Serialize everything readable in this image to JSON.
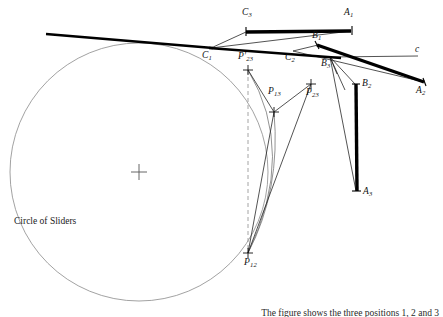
{
  "figure": {
    "title_text": "Circle of Sliders",
    "caption_tail": "The figure shows the three positions 1, 2 and 3",
    "colors": {
      "thick_link": "#000000",
      "thin_line": "#1a1a1a",
      "circle": "#8a8a8a",
      "dashed": "#9a9a9a",
      "arc": "#6f6f6f",
      "background": "#ffffff"
    },
    "circle_of_sliders": {
      "label": "Circle of Sliders",
      "label_x": 14,
      "label_y": 221,
      "cx": 139,
      "cy": 172,
      "r": 129,
      "center_marker": "cross"
    },
    "points": [
      {
        "id": "C1",
        "label": "C",
        "sub": "1",
        "x": 211,
        "y": 48,
        "lx": 203,
        "ly": 52,
        "marker": "none"
      },
      {
        "id": "C2",
        "label": "C",
        "sub": "2",
        "x": 293,
        "y": 51,
        "lx": 286,
        "ly": 54,
        "marker": "none"
      },
      {
        "id": "C3",
        "label": "C",
        "sub": "3",
        "x": 330,
        "y": 57,
        "lx": 322,
        "ly": 60,
        "marker": "none"
      },
      {
        "id": "A1",
        "label": "A",
        "sub": "1",
        "x": 246,
        "y": 31,
        "lx": 242,
        "ly": 12,
        "marker": "none"
      },
      {
        "id": "B1",
        "label": "B",
        "sub": "1",
        "x": 351,
        "y": 30,
        "lx": 344,
        "ly": 12,
        "marker": "none"
      },
      {
        "id": "A2",
        "label": "A",
        "sub": "2",
        "x": 318,
        "y": 44,
        "lx": 313,
        "ly": 36,
        "marker": "none"
      },
      {
        "id": "B2",
        "label": "B",
        "sub": "2",
        "x": 424,
        "y": 82,
        "lx": 417,
        "ly": 87,
        "marker": "none"
      },
      {
        "id": "A3",
        "label": "A",
        "sub": "3",
        "x": 356,
        "y": 83,
        "lx": 360,
        "ly": 82,
        "marker": "none"
      },
      {
        "id": "B3",
        "label": "B",
        "sub": "3",
        "x": 356,
        "y": 192,
        "lx": 360,
        "ly": 190,
        "marker": "none"
      },
      {
        "id": "P12",
        "label": "P",
        "sub": "12",
        "x": 248,
        "y": 253,
        "lx": 247,
        "ly": 261,
        "marker": "cross"
      },
      {
        "id": "P13",
        "label": "P",
        "sub": "13",
        "x": 274,
        "y": 112,
        "lx": 273,
        "ly": 90,
        "marker": "cross"
      },
      {
        "id": "P23",
        "label": "P",
        "sub": "23",
        "x": 311,
        "y": 84,
        "lx": 310,
        "ly": 91,
        "marker": "cross"
      },
      {
        "id": "P23p",
        "label": "P",
        "sub": "23",
        "prime": true,
        "x": 248,
        "y": 70,
        "lx": 242,
        "ly": 55,
        "marker": "cross"
      },
      {
        "id": "c",
        "label": "c",
        "sub": "",
        "x": 418,
        "y": 56,
        "lx": 416,
        "ly": 48,
        "marker": "none"
      }
    ],
    "thick_links": [
      {
        "name": "link-A1-B1",
        "x1": 246,
        "y1": 32,
        "x2": 351,
        "y2": 31,
        "width": 3.4
      },
      {
        "name": "link-A2-B2",
        "x1": 318,
        "y1": 45,
        "x2": 424,
        "y2": 82,
        "width": 3.4
      },
      {
        "name": "link-A3-B3",
        "x1": 356,
        "y1": 84,
        "x2": 357,
        "y2": 191,
        "width": 3.4
      },
      {
        "name": "link-ground-C1",
        "x1": 46,
        "y1": 34,
        "x2": 211,
        "y2": 48,
        "width": 3.0
      },
      {
        "name": "link-C1-line-c",
        "x1": 211,
        "y1": 48,
        "x2": 340,
        "y2": 58,
        "width": 2.6
      }
    ],
    "thin_lines": [
      {
        "name": "C1-A1",
        "x1": 211,
        "y1": 48,
        "x2": 246,
        "y2": 31
      },
      {
        "name": "C1-B1",
        "x1": 211,
        "y1": 48,
        "x2": 351,
        "y2": 31
      },
      {
        "name": "C1-C2",
        "x1": 211,
        "y1": 48,
        "x2": 293,
        "y2": 51
      },
      {
        "name": "C2-A2",
        "x1": 293,
        "y1": 51,
        "x2": 318,
        "y2": 44
      },
      {
        "name": "C2-B2",
        "x1": 293,
        "y1": 51,
        "x2": 424,
        "y2": 82
      },
      {
        "name": "C2-C3",
        "x1": 293,
        "y1": 51,
        "x2": 330,
        "y2": 57
      },
      {
        "name": "C3-A3",
        "x1": 330,
        "y1": 57,
        "x2": 356,
        "y2": 84
      },
      {
        "name": "C3-B3",
        "x1": 330,
        "y1": 57,
        "x2": 357,
        "y2": 191
      },
      {
        "name": "C3-to-c",
        "x1": 330,
        "y1": 57,
        "x2": 418,
        "y2": 56
      },
      {
        "name": "P23p-P13",
        "x1": 248,
        "y1": 70,
        "x2": 274,
        "y2": 112
      },
      {
        "name": "P13-P23",
        "x1": 274,
        "y1": 112,
        "x2": 311,
        "y2": 84
      },
      {
        "name": "P13-P12",
        "x1": 274,
        "y1": 112,
        "x2": 248,
        "y2": 253
      },
      {
        "name": "P23-P12",
        "x1": 311,
        "y1": 84,
        "x2": 248,
        "y2": 253
      },
      {
        "name": "C3-P12-a",
        "x1": 330,
        "y1": 57,
        "x2": 340,
        "y2": 70
      },
      {
        "name": "C3-P12-b",
        "x1": 330,
        "y1": 57,
        "x2": 352,
        "y2": 84
      }
    ],
    "dashed_lines": [
      {
        "name": "vertical-P23p-P12",
        "x1": 248,
        "y1": 70,
        "x2": 248,
        "y2": 253
      }
    ],
    "arcs": [
      {
        "name": "arc-P23p-P12",
        "d": "M248,70 Q296,150 248,253"
      },
      {
        "name": "arc-P13-P12",
        "d": "M274,112 Q278,190 248,253"
      }
    ]
  }
}
